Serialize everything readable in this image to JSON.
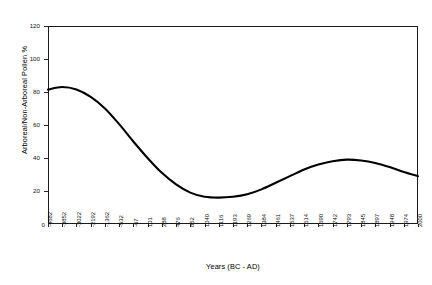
{
  "chart_data": {
    "type": "line",
    "title": "",
    "subtitle": "",
    "xlabel": "Years (BC - AD)",
    "ylabel": "Arboreal/Non-Arboreal Pollen %",
    "ylim": [
      0,
      120
    ],
    "ytick_labels": [
      "0",
      "20",
      "40",
      "60",
      "80",
      "100",
      "120"
    ],
    "ytick_values": [
      0,
      20,
      40,
      60,
      80,
      100,
      120
    ],
    "grid": false,
    "legend": null,
    "legend_position": "none",
    "line_color": "#000000",
    "background_color": "#ffffff",
    "axis_color": "#1a1a1a",
    "categories": [
      "-4682",
      "-3852",
      "-3022",
      "-2192",
      "-1362",
      "-532",
      "-67",
      "101",
      "288",
      "476",
      "852",
      "1040",
      "1116",
      "1193",
      "1269",
      "1384",
      "1461",
      "1537",
      "1614",
      "1690",
      "1742",
      "1793",
      "1845",
      "1897",
      "1948",
      "1974",
      "2000"
    ],
    "values": [
      81.5,
      83.0,
      81.5,
      77.0,
      70.0,
      60.5,
      50.0,
      40.0,
      31.0,
      24.0,
      19.0,
      16.5,
      16.0,
      16.5,
      18.0,
      21.0,
      25.0,
      29.0,
      33.0,
      36.0,
      38.0,
      39.0,
      38.5,
      37.0,
      34.5,
      31.5,
      29.0
    ],
    "series": [
      {
        "name": "Arboreal/Non-Arboreal Pollen %",
        "values": [
          81.5,
          83.0,
          81.5,
          77.0,
          70.0,
          60.5,
          50.0,
          40.0,
          31.0,
          24.0,
          19.0,
          16.5,
          16.0,
          16.5,
          18.0,
          21.0,
          25.0,
          29.0,
          33.0,
          36.0,
          38.0,
          39.0,
          38.5,
          37.0,
          34.5,
          31.5,
          29.0
        ]
      }
    ],
    "annotations": []
  }
}
